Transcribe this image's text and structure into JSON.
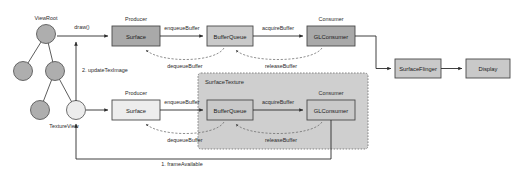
{
  "diagram": {
    "colors": {
      "background": "#ffffff",
      "box_dark_fill": "#a9a9a9",
      "box_light_fill": "#ededed",
      "box_mid_fill": "#c9c9c9",
      "group_fill": "#cfcfcf",
      "node_gray_fill": "#aeaeae",
      "node_light_fill": "#ececec",
      "stroke": "#4a4a4a",
      "text": "#1a1a1a",
      "dashed_stroke": "#6b6b6b"
    },
    "tree": {
      "root_label": "ViewRoot",
      "leaf_label": "TextureView",
      "nodes": [
        {
          "id": "root",
          "cx": 46,
          "cy": 34,
          "r": 9.5,
          "fill": "#aeaeae"
        },
        {
          "id": "left-child",
          "cx": 23,
          "cy": 71,
          "r": 9.5,
          "fill": "#aeaeae"
        },
        {
          "id": "right-child",
          "cx": 55,
          "cy": 71,
          "r": 9.5,
          "fill": "#aeaeae"
        },
        {
          "id": "grandchild-left",
          "cx": 40,
          "cy": 110,
          "r": 9.5,
          "fill": "#aeaeae"
        },
        {
          "id": "textureview-node",
          "cx": 76,
          "cy": 110,
          "r": 9.5,
          "fill": "#ececec"
        }
      ],
      "edges": [
        {
          "from": "root",
          "to": "left-child"
        },
        {
          "from": "root",
          "to": "right-child"
        },
        {
          "from": "right-child",
          "to": "grandchild-left"
        },
        {
          "from": "right-child",
          "to": "textureview-node"
        }
      ]
    },
    "boxes": [
      {
        "id": "surface-top",
        "label": "Surface",
        "caption": "Producer",
        "x": 112,
        "y": 26,
        "w": 48,
        "h": 20,
        "fill": "#a9a9a9"
      },
      {
        "id": "bufferqueue-top",
        "label": "BufferQueue",
        "caption": "",
        "x": 207,
        "y": 26,
        "w": 46,
        "h": 20,
        "fill": "#c9c9c9"
      },
      {
        "id": "glconsumer-top",
        "label": "GLConsumer",
        "caption": "Consumer",
        "x": 307,
        "y": 26,
        "w": 48,
        "h": 20,
        "fill": "#a9a9a9"
      },
      {
        "id": "surfaceflinger",
        "label": "SurfaceFlinger",
        "caption": "",
        "x": 395,
        "y": 59,
        "w": 46,
        "h": 19,
        "fill": "#c9c9c9"
      },
      {
        "id": "display",
        "label": "Display",
        "caption": "",
        "x": 466,
        "y": 59,
        "w": 44,
        "h": 19,
        "fill": "#c9c9c9"
      },
      {
        "id": "surface-bottom",
        "label": "Surface",
        "caption": "Producer",
        "x": 112,
        "y": 100,
        "w": 48,
        "h": 20,
        "fill": "#ededed"
      },
      {
        "id": "bufferqueue-bottom",
        "label": "BufferQueue",
        "caption": "",
        "x": 207,
        "y": 100,
        "w": 46,
        "h": 20,
        "fill": "#c9c9c9"
      },
      {
        "id": "glconsumer-bottom",
        "label": "GLConsumer",
        "caption": "Consumer",
        "x": 307,
        "y": 100,
        "w": 48,
        "h": 20,
        "fill": "#c9c9c9"
      }
    ],
    "group": {
      "id": "surfacetexture-group",
      "label": "SurfaceTexture",
      "x": 198,
      "y": 73,
      "w": 170,
      "h": 76,
      "fill": "#cfcfcf"
    },
    "edge_labels": {
      "draw": "draw()",
      "enqueue_top": "enqueueBuffer",
      "dequeue_top": "dequeueBuffer",
      "acquire_top": "acquireBuffer",
      "release_top": "releaseBuffer",
      "enqueue_bottom": "enqueueBuffer",
      "dequeue_bottom": "dequeueBuffer",
      "acquire_bottom": "acquireBuffer",
      "release_bottom": "releaseBuffer",
      "update_teximage": "2. updateTexImage",
      "frame_available": "1. frameAvailable"
    },
    "captions": {
      "producer": "Producer",
      "consumer": "Consumer"
    }
  }
}
